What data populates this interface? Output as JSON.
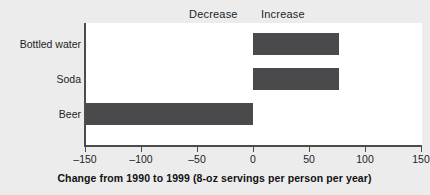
{
  "chart_data": {
    "type": "bar",
    "orientation": "horizontal",
    "title": "",
    "xlabel": "Change from 1990 to 1999 (8-oz servings per person per year)",
    "ylabel": "",
    "categories": [
      "Bottled water",
      "Soda",
      "Beer"
    ],
    "values": [
      77,
      77,
      -150
    ],
    "xlim": [
      -150,
      150
    ],
    "xticks": [
      -150,
      -100,
      -50,
      0,
      50,
      100,
      150
    ],
    "xtick_labels": [
      "–150",
      "–100",
      "–50",
      "0",
      "50",
      "100",
      "150"
    ],
    "grid": false,
    "legend": "none",
    "annotations": [
      {
        "text": "Decrease",
        "side": "left"
      },
      {
        "text": "Increase",
        "side": "right"
      }
    ],
    "series": [
      {
        "name": "Change in servings",
        "values": [
          77,
          77,
          -150
        ]
      }
    ],
    "colors": {
      "bar": "#4a4a4c",
      "plot_background": "#ffffff",
      "figure_background": "#ececed",
      "axis": "#4c4c4c",
      "text": "#1d1d1d"
    }
  },
  "annotations": {
    "decrease": "Decrease",
    "increase": "Increase"
  },
  "axis": {
    "title": "Change from 1990 to 1999 (8-oz servings per person per year)"
  }
}
